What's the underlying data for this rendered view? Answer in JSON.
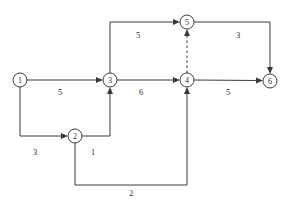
{
  "diagram": {
    "type": "directed-network",
    "width": 287,
    "height": 205,
    "stroke_color": "#3a3a3a",
    "text_color": "#2b2b2b",
    "background_color": "#ffffff",
    "nodes": [
      {
        "id": "1",
        "label": "1",
        "x": 20,
        "y": 80,
        "r": 7
      },
      {
        "id": "2",
        "label": "2",
        "x": 75,
        "y": 136,
        "r": 7
      },
      {
        "id": "3",
        "label": "3",
        "x": 110,
        "y": 80,
        "r": 7
      },
      {
        "id": "4",
        "label": "4",
        "x": 187,
        "y": 80,
        "r": 7
      },
      {
        "id": "5",
        "label": "5",
        "x": 187,
        "y": 22,
        "r": 7
      },
      {
        "id": "6",
        "label": "6",
        "x": 270,
        "y": 81,
        "r": 7
      }
    ],
    "edges": [
      {
        "id": "e1-3",
        "from": "1",
        "to": "3",
        "weight": "5",
        "style": "solid",
        "label_x": 60,
        "label_y": 92
      },
      {
        "id": "e1-2",
        "from": "1",
        "to": "2",
        "weight": "3",
        "style": "solid",
        "label_x": 35,
        "label_y": 152
      },
      {
        "id": "e2-3",
        "from": "2",
        "to": "3",
        "weight": "1",
        "style": "solid",
        "label_x": 93,
        "label_y": 152
      },
      {
        "id": "e2-4",
        "from": "2",
        "to": "4",
        "weight": "2",
        "style": "solid",
        "label_x": 131,
        "label_y": 193
      },
      {
        "id": "e3-4",
        "from": "3",
        "to": "4",
        "weight": "6",
        "style": "solid",
        "label_x": 141,
        "label_y": 92
      },
      {
        "id": "e3-5",
        "from": "3",
        "to": "5",
        "weight": "5",
        "style": "solid",
        "label_x": 138,
        "label_y": 35
      },
      {
        "id": "e5-6",
        "from": "5",
        "to": "6",
        "weight": "3",
        "style": "solid",
        "label_x": 238,
        "label_y": 35
      },
      {
        "id": "e4-6",
        "from": "4",
        "to": "6",
        "weight": "5",
        "style": "solid",
        "label_x": 228,
        "label_y": 92
      },
      {
        "id": "e4-5",
        "from": "4",
        "to": "5",
        "weight": "",
        "style": "dashed",
        "label_x": 0,
        "label_y": 0
      }
    ]
  }
}
